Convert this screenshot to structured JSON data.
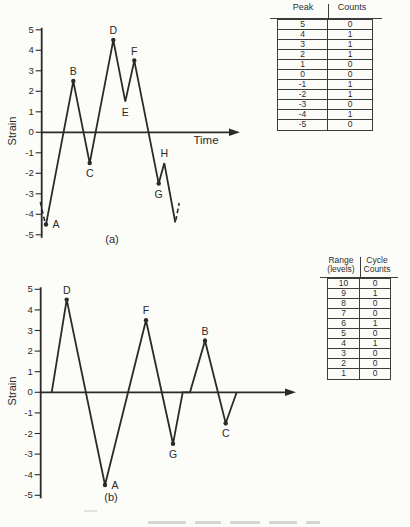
{
  "colors": {
    "ink": "#2a2a2a",
    "paper": "#fcfcf9",
    "table_line": "#3c3c3c"
  },
  "chart_data": [
    {
      "id": "a",
      "type": "line",
      "panel": "(a)",
      "ylabel": "Strain",
      "xlabel": "Time",
      "ylim": [
        -5,
        5
      ],
      "yticks": [
        5,
        4,
        3,
        2,
        1,
        0,
        -1,
        -2,
        -3,
        -4,
        -5
      ],
      "x_unit": "px (no time scale shown)",
      "points": [
        {
          "x": 46,
          "y": -4.5,
          "label": "A",
          "dot": true,
          "label_pos": "right"
        },
        {
          "x": 73.3,
          "y": 2.5,
          "label": "B",
          "dot": true,
          "label_pos": "above"
        },
        {
          "x": 89.7,
          "y": -1.5,
          "label": "C",
          "dot": true,
          "label_pos": "below"
        },
        {
          "x": 113.3,
          "y": 4.5,
          "label": "D",
          "dot": true,
          "label_pos": "above"
        },
        {
          "x": 125.3,
          "y": 1.5,
          "label": "E",
          "dot": false,
          "label_pos": "below"
        },
        {
          "x": 134.3,
          "y": 3.5,
          "label": "F",
          "dot": true,
          "label_pos": "above"
        },
        {
          "x": 158.7,
          "y": -2.5,
          "label": "G",
          "dot": true,
          "label_pos": "below"
        },
        {
          "x": 164.3,
          "y": -1.5,
          "label": "H",
          "dot": false,
          "label_pos": "above"
        },
        {
          "x": 175.3,
          "y": -4.4
        }
      ],
      "dashed": [
        [
          [
            40.3,
            -3.4
          ],
          [
            44.8,
            -4.35
          ]
        ],
        [
          [
            175.8,
            -4.3
          ],
          [
            179.2,
            -3.45
          ]
        ]
      ]
    },
    {
      "id": "b",
      "type": "line",
      "panel": "(b)",
      "ylabel": "Strain",
      "xlabel": "",
      "ylim": [
        -5,
        5
      ],
      "yticks": [
        5,
        4,
        3,
        2,
        1,
        0,
        -1,
        -2,
        -3,
        -4,
        -5
      ],
      "x_unit": "px (no time scale shown)",
      "points": [
        {
          "x": 51.7,
          "y": 0
        },
        {
          "x": 66.7,
          "y": 4.5,
          "label": "D",
          "dot": true,
          "label_pos": "above"
        },
        {
          "x": 105,
          "y": -4.5,
          "label": "A",
          "dot": true,
          "label_pos": "right"
        },
        {
          "x": 146,
          "y": 3.5,
          "label": "F",
          "dot": true,
          "label_pos": "above"
        },
        {
          "x": 173,
          "y": -2.5,
          "label": "G",
          "dot": true,
          "label_pos": "below"
        },
        {
          "x": 182.7,
          "y": 0
        },
        {
          "x": 190,
          "y": 0
        },
        {
          "x": 205,
          "y": 2.5,
          "label": "B",
          "dot": true,
          "label_pos": "above"
        },
        {
          "x": 225.7,
          "y": -1.5,
          "label": "C",
          "dot": true,
          "label_pos": "below"
        },
        {
          "x": 236.7,
          "y": 0
        }
      ],
      "dashed": []
    }
  ],
  "tables": {
    "peak": {
      "col1_header": "Peak",
      "col2_header": "Counts",
      "rows": [
        [
          "5",
          "0"
        ],
        [
          "4",
          "1"
        ],
        [
          "3",
          "1"
        ],
        [
          "2",
          "1"
        ],
        [
          "1",
          "0"
        ],
        [
          "0",
          "0"
        ],
        [
          "-1",
          "1"
        ],
        [
          "-2",
          "1"
        ],
        [
          "-3",
          "0"
        ],
        [
          "-4",
          "1"
        ],
        [
          "-5",
          "0"
        ]
      ]
    },
    "range": {
      "col1_header_line1": "Range",
      "col1_header_line2": "(levels)",
      "col2_header_line1": "Cycle",
      "col2_header_line2": "Counts",
      "rows": [
        [
          "10",
          "0"
        ],
        [
          "9",
          "1"
        ],
        [
          "8",
          "0"
        ],
        [
          "7",
          "0"
        ],
        [
          "6",
          "1"
        ],
        [
          "5",
          "0"
        ],
        [
          "4",
          "1"
        ],
        [
          "3",
          "0"
        ],
        [
          "2",
          "0"
        ],
        [
          "1",
          "0"
        ]
      ]
    }
  }
}
